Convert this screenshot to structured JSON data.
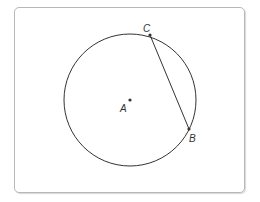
{
  "diagram": {
    "colors": {
      "stroke": "#333333",
      "frame": "#b8b8b8",
      "background": "#ffffff"
    },
    "circle": {
      "center_label": "A",
      "cx": 130,
      "cy": 100,
      "r": 66
    },
    "points": [
      {
        "label": "A",
        "x": 130,
        "y": 100
      },
      {
        "label": "B",
        "x": 189,
        "y": 129
      },
      {
        "label": "C",
        "x": 150,
        "y": 35
      }
    ],
    "segments": [
      {
        "from": "C",
        "to": "B"
      }
    ]
  }
}
